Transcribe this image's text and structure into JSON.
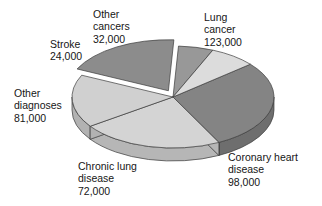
{
  "chart_data": {
    "type": "pie",
    "title": "",
    "subtitle": "",
    "xlabel": "",
    "ylabel": "",
    "total": 430000,
    "units": "deaths",
    "legend_position": "none",
    "grid": false,
    "style": "3d-exploded-pie",
    "labels_show_value": true,
    "categories": [
      "Lung cancer",
      "Coronary heart disease",
      "Chronic lung disease",
      "Other diagnoses",
      "Stroke",
      "Other cancers"
    ],
    "values": [
      123000,
      98000,
      72000,
      81000,
      24000,
      32000
    ],
    "value_labels": [
      "123,000",
      "98,000",
      "72,000",
      "81,000",
      "24,000",
      "32,000"
    ],
    "percentages": [
      28.6,
      22.8,
      16.7,
      18.8,
      5.6,
      7.4
    ],
    "slices": [
      {
        "name": "Lung cancer",
        "value": 123000,
        "value_label": "123,000",
        "percent": 28.6,
        "color": "#848484",
        "side_color": "#6e6e6e",
        "exploded": false,
        "label_lines": [
          "Lung",
          "cancer",
          "123,000"
        ]
      },
      {
        "name": "Coronary heart disease",
        "value": 98000,
        "value_label": "98,000",
        "percent": 22.8,
        "color": "#d4d4d4",
        "side_color": "#b6b6b6",
        "exploded": false,
        "label_lines": [
          "Coronary heart",
          "disease",
          "98,000"
        ]
      },
      {
        "name": "Chronic lung disease",
        "value": 72000,
        "value_label": "72,000",
        "percent": 16.7,
        "color": "#d0d0d0",
        "side_color": "#b2b2b2",
        "exploded": false,
        "label_lines": [
          "Chronic lung",
          "disease",
          "72,000"
        ]
      },
      {
        "name": "Other diagnoses",
        "value": 81000,
        "value_label": "81,000",
        "percent": 18.8,
        "color": "#8c8c8c",
        "side_color": "#767676",
        "exploded": true,
        "label_lines": [
          "Other",
          "diagnoses",
          "81,000"
        ]
      },
      {
        "name": "Stroke",
        "value": 24000,
        "value_label": "24,000",
        "percent": 5.6,
        "color": "#989898",
        "side_color": "#7f7f7f",
        "exploded": false,
        "label_lines": [
          "Stroke",
          "24,000"
        ]
      },
      {
        "name": "Other cancers",
        "value": 32000,
        "value_label": "32,000",
        "percent": 7.4,
        "color": "#dcdcdc",
        "side_color": "#bebebe",
        "exploded": false,
        "label_lines": [
          "Other",
          "cancers",
          "32,000"
        ]
      }
    ]
  },
  "labels": {
    "lung_cancer": {
      "line1": "Lung",
      "line2": "cancer",
      "line3": "123,000"
    },
    "other_cancers": {
      "line1": "Other",
      "line2": "cancers",
      "line3": "32,000"
    },
    "stroke": {
      "line1": "Stroke",
      "line2": "24,000"
    },
    "other_diagnoses": {
      "line1": "Other",
      "line2": "diagnoses",
      "line3": "81,000"
    },
    "chronic_lung_disease": {
      "line1": "Chronic lung",
      "line2": "disease",
      "line3": "72,000"
    },
    "coronary_heart_disease": {
      "line1": "Coronary heart",
      "line2": "disease",
      "line3": "98,000"
    }
  },
  "colors": {
    "background": "#ffffff",
    "text": "#161616",
    "dark_slice": "#848484",
    "light_slice": "#d4d4d4",
    "outline": "#3c3c3c"
  }
}
